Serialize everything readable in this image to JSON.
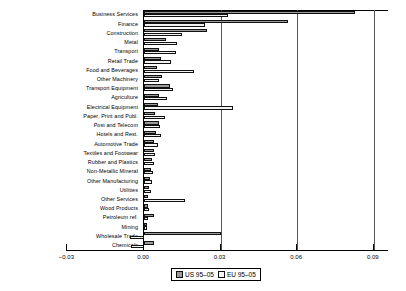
{
  "chart_data": {
    "type": "bar",
    "orientation": "horizontal",
    "title": "",
    "xlabel": "",
    "ylabel": "",
    "xlim": [
      -0.03,
      0.09
    ],
    "xticks": [
      "-0.03",
      "0.00",
      "0.03",
      "0.06",
      "0.09"
    ],
    "xtick_values": [
      -0.03,
      0.0,
      0.03,
      0.06,
      0.09
    ],
    "grid": true,
    "legend_position": "bottom",
    "categories": [
      "Business Services",
      "Finance",
      "Construction",
      "Metal",
      "Transport",
      "Retail Trade",
      "Food and Beverages",
      "Other Machinery",
      "Transport Equipment",
      "Agriculture",
      "Electrical Equipment",
      "Paper, Print and Publ.",
      "Post and Telecom",
      "Hotels and Rest.",
      "Automotive Trade",
      "Textiles and Footwear",
      "Rubber and Plastics",
      "Non-Metallic Mineral",
      "Other Manufacturing",
      "Utilities",
      "Other Services",
      "Wood Products",
      "Petroleum ref.",
      "Mining",
      "Wholesale Trade",
      "Chemicals"
    ],
    "series": [
      {
        "name": "US 95-05",
        "color": "#9a9a9a",
        "values": [
          0.0825,
          0.0565,
          0.0245,
          0.0085,
          0.006,
          0.0065,
          0.005,
          0.0072,
          0.01,
          0.0058,
          0.0055,
          0.0045,
          0.006,
          0.0048,
          0.004,
          0.0038,
          0.003,
          0.0026,
          0.0024,
          0.002,
          0.0017,
          0.0014,
          0.004,
          0.001,
          0.03,
          0.004
        ]
      },
      {
        "name": "EU 95-05",
        "color": "#f2f2f2",
        "values": [
          0.033,
          0.024,
          0.015,
          0.013,
          0.0125,
          0.0105,
          0.0195,
          0.006,
          0.0115,
          0.0092,
          0.035,
          0.0082,
          0.0062,
          0.0068,
          0.0055,
          0.0042,
          0.0038,
          0.0035,
          0.003,
          0.0026,
          0.016,
          0.002,
          0.0016,
          0.001,
          -0.0055,
          -0.005
        ]
      }
    ]
  },
  "legend": {
    "entries": [
      {
        "label": "US 95–05",
        "swatch": "us"
      },
      {
        "label": "EU 95–05",
        "swatch": "eu"
      }
    ]
  }
}
